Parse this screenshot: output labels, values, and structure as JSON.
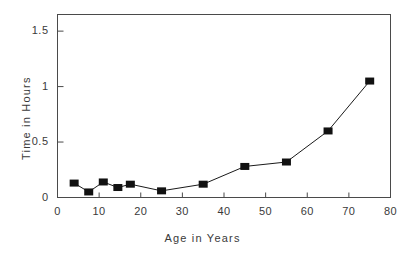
{
  "chart_data": {
    "type": "line",
    "title": "",
    "subtitle": "",
    "xlabel": "Age in Years",
    "ylabel": "Time in Hours",
    "xlim": [
      0,
      80
    ],
    "ylim": [
      0,
      1.65
    ],
    "xticks": [
      "0",
      "10",
      "20",
      "30",
      "40",
      "50",
      "60",
      "70",
      "80"
    ],
    "xtick_values": [
      0,
      10,
      20,
      30,
      40,
      50,
      60,
      70,
      80
    ],
    "yticks": [
      "0",
      "0.5",
      "1",
      "1.5"
    ],
    "ytick_values": [
      0,
      0.5,
      1,
      1.5
    ],
    "grid": false,
    "legend": null,
    "marker": "filled-square",
    "line_color": "#1a1a1a",
    "marker_color": "#111111",
    "frame_color": "#4a4a4a",
    "background": "#ffffff",
    "x": [
      4,
      7.5,
      11,
      14.5,
      17.5,
      25,
      35,
      45,
      55,
      65,
      75
    ],
    "y": [
      0.13,
      0.05,
      0.14,
      0.09,
      0.12,
      0.06,
      0.12,
      0.28,
      0.32,
      0.6,
      1.05
    ],
    "series": [
      {
        "name": "Time in Hours",
        "points": [
          {
            "x": 4,
            "y": 0.13
          },
          {
            "x": 7.5,
            "y": 0.05
          },
          {
            "x": 11,
            "y": 0.14
          },
          {
            "x": 14.5,
            "y": 0.09
          },
          {
            "x": 17.5,
            "y": 0.12
          },
          {
            "x": 25,
            "y": 0.06
          },
          {
            "x": 35,
            "y": 0.12
          },
          {
            "x": 45,
            "y": 0.28
          },
          {
            "x": 55,
            "y": 0.32
          },
          {
            "x": 65,
            "y": 0.6
          },
          {
            "x": 75,
            "y": 1.05
          }
        ]
      }
    ],
    "annotations": []
  }
}
